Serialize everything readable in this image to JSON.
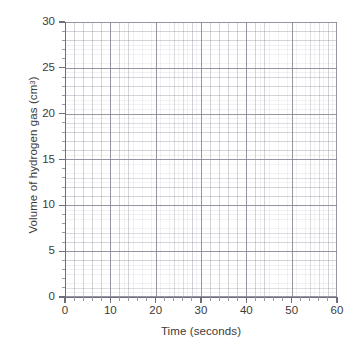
{
  "chart_data": {
    "type": "line",
    "title": "",
    "subtitle": "",
    "xlabel": "Time (seconds)",
    "ylabel": "Volume of hydrogen gas (cm3)",
    "ylabel_base": "Volume of hydrogen gas (cm",
    "ylabel_sup": "3",
    "ylabel_tail": ")",
    "xlim": [
      0,
      60
    ],
    "ylim": [
      0,
      30
    ],
    "x_major_step": 10,
    "y_major_step": 5,
    "x_minor_step": 2,
    "y_minor_step": 1,
    "x_ticks": [
      0,
      10,
      20,
      30,
      40,
      50,
      60
    ],
    "y_ticks": [
      0,
      5,
      10,
      15,
      20,
      25,
      30
    ],
    "x_tick_labels": [
      "0",
      "10",
      "20",
      "30",
      "40",
      "50",
      "60"
    ],
    "y_tick_labels": [
      "0",
      "5",
      "10",
      "15",
      "20",
      "25",
      "30"
    ],
    "grid": true,
    "grid_minor": true,
    "legend": false,
    "legend_entries": [],
    "annotations": [],
    "series": [],
    "data_points": [],
    "note": "Blank graph paper / empty axes - no data plotted"
  },
  "colors": {
    "background": "#ffffff",
    "axis": "#6e6e7a",
    "text": "#3b3b3b",
    "grid_major": "#7a7a8a",
    "grid_minor": "#8c8c9e",
    "grid_subminor": "#9696a5"
  }
}
